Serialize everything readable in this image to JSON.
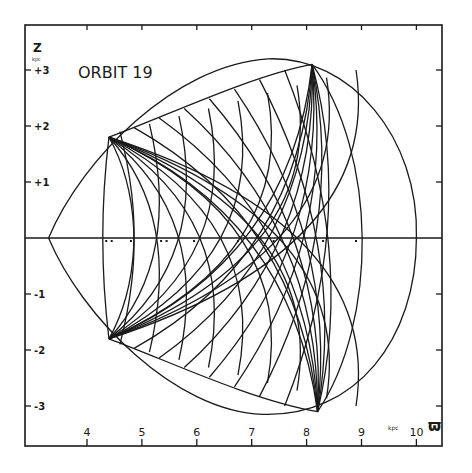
{
  "chart_data": {
    "type": "line",
    "title": "ORBIT 19",
    "xlabel": "ϖ",
    "xunit": "kpc",
    "ylabel": "Z",
    "yunit": "kpc",
    "xlim": [
      3.0,
      10.5
    ],
    "ylim": [
      -3.6,
      3.8
    ],
    "xticks": [
      "4",
      "5",
      "6",
      "7",
      "8",
      "9",
      "10"
    ],
    "yticks": [
      "+3",
      "+2",
      "+1",
      "-1",
      "-2",
      "-3"
    ],
    "grid": false,
    "legend": null,
    "series": [
      {
        "name": "zero-velocity envelope",
        "description": "closed outer curve",
        "left_tip": [
          3.3,
          0.0
        ],
        "top": [
          8.1,
          3.05
        ],
        "right": [
          10.0,
          0.0
        ],
        "bottom": [
          8.15,
          -3.1
        ]
      },
      {
        "name": "orbit 19 trajectory",
        "description": "box orbit filling region",
        "corners": [
          [
            4.4,
            1.8
          ],
          [
            8.1,
            3.1
          ],
          [
            4.4,
            -1.8
          ],
          [
            8.2,
            -3.1
          ]
        ],
        "rmin": 4.35,
        "rmax": 9.15
      }
    ]
  },
  "labels": {
    "title": "ORBIT 19",
    "z_axis": "Z",
    "z_unit": "kpc",
    "x_unit": "kpc",
    "x_symbol": "ϖ"
  }
}
